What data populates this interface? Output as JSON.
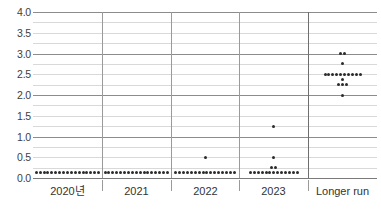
{
  "chart_data": {
    "type": "scatter",
    "title": "",
    "xlabel": "",
    "ylabel": "",
    "ylim": [
      0.0,
      4.0
    ],
    "ytick_values": [
      4.0,
      3.5,
      3.0,
      2.5,
      2.0,
      1.5,
      1.0,
      0.5,
      0.0
    ],
    "ytick_labels": [
      "4.0",
      "3.5",
      "3.0",
      "2.5",
      "2.0",
      "1.5",
      "1.0",
      "0.5",
      "0.0"
    ],
    "minor_gridlines": [
      3.75,
      3.25,
      2.75,
      2.25,
      1.75,
      1.25,
      0.75,
      0.25
    ],
    "major_gridlines": [
      4.0,
      3.0,
      2.0,
      1.0,
      0.0
    ],
    "grid": true,
    "legend": "none",
    "categories": [
      "2020년",
      "2021",
      "2022",
      "2023",
      "Longer run"
    ],
    "series": [
      {
        "name": "2020년",
        "points": [
          {
            "value": 0.125,
            "count": 17
          }
        ]
      },
      {
        "name": "2021",
        "points": [
          {
            "value": 0.125,
            "count": 17
          }
        ]
      },
      {
        "name": "2022",
        "points": [
          {
            "value": 0.5,
            "count": 1
          },
          {
            "value": 0.125,
            "count": 16
          }
        ]
      },
      {
        "name": "2023",
        "points": [
          {
            "value": 1.25,
            "count": 1
          },
          {
            "value": 0.5,
            "count": 1
          },
          {
            "value": 0.25,
            "count": 2
          },
          {
            "value": 0.125,
            "count": 13
          }
        ]
      },
      {
        "name": "Longer run",
        "points": [
          {
            "value": 3.0,
            "count": 2
          },
          {
            "value": 2.75,
            "count": 1
          },
          {
            "value": 2.5,
            "count": 10
          },
          {
            "value": 2.375,
            "count": 1
          },
          {
            "value": 2.25,
            "count": 3
          },
          {
            "value": 2.0,
            "count": 1
          }
        ]
      }
    ],
    "dot_color": "#2b2b2b",
    "gridline_color": "#d9d9d9",
    "axis_color": "#8c8c8c"
  }
}
